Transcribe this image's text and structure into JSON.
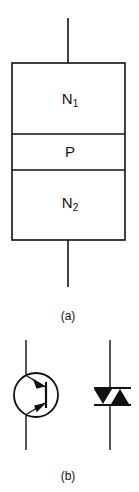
{
  "diagram": {
    "part_a": {
      "caption": "(a)",
      "layers": [
        {
          "name": "N",
          "subscript": "1"
        },
        {
          "name": "P",
          "subscript": ""
        },
        {
          "name": "N",
          "subscript": "2"
        }
      ]
    },
    "part_b": {
      "caption": "(b)",
      "symbols": [
        "bipolar-transistor-symbol",
        "diac-symbol"
      ]
    },
    "colors": {
      "line": "#111111",
      "background": "#ffffff"
    }
  }
}
